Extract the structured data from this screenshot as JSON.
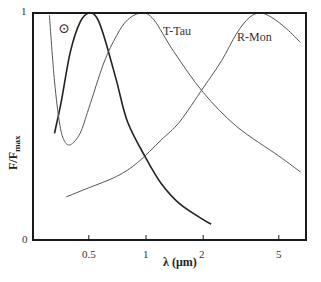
{
  "chart_data": {
    "type": "line",
    "title": "",
    "xlabel": "λ (μm)",
    "ylabel": "F/F_max",
    "ylabel_main": "F/F",
    "ylabel_sub": "max",
    "x_scale": "log",
    "xlim": [
      0.3,
      7
    ],
    "ylim": [
      0,
      1
    ],
    "x_ticks": [
      0.5,
      1,
      2,
      5
    ],
    "x_tick_labels": [
      "0.5",
      "1",
      "2",
      "5"
    ],
    "y_ticks": [
      0,
      1
    ],
    "y_tick_labels": [
      "0",
      "1"
    ],
    "grid": false,
    "legend": "none",
    "annotations": [
      {
        "text": "⊙",
        "x": 0.4,
        "y": 0.9,
        "meaning": "Sun"
      },
      {
        "text": "T-Tau",
        "x": 1.2,
        "y": 0.93
      },
      {
        "text": "R-Mon",
        "x": 3.6,
        "y": 0.83
      }
    ],
    "series": [
      {
        "name": "Sun",
        "points": [
          [
            0.33,
            0.47
          ],
          [
            0.36,
            0.62
          ],
          [
            0.4,
            0.83
          ],
          [
            0.45,
            0.96
          ],
          [
            0.5,
            1.0
          ],
          [
            0.55,
            0.98
          ],
          [
            0.6,
            0.9
          ],
          [
            0.7,
            0.7
          ],
          [
            0.8,
            0.52
          ],
          [
            1.0,
            0.36
          ],
          [
            1.2,
            0.25
          ],
          [
            1.5,
            0.16
          ],
          [
            2.0,
            0.09
          ],
          [
            2.2,
            0.07
          ]
        ]
      },
      {
        "name": "T-Tau",
        "points": [
          [
            0.31,
            0.99
          ],
          [
            0.33,
            0.7
          ],
          [
            0.35,
            0.52
          ],
          [
            0.37,
            0.44
          ],
          [
            0.4,
            0.42
          ],
          [
            0.45,
            0.47
          ],
          [
            0.5,
            0.58
          ],
          [
            0.6,
            0.78
          ],
          [
            0.7,
            0.9
          ],
          [
            0.8,
            0.97
          ],
          [
            0.95,
            1.0
          ],
          [
            1.1,
            0.97
          ],
          [
            1.4,
            0.83
          ],
          [
            2.0,
            0.65
          ],
          [
            3.0,
            0.5
          ],
          [
            5.0,
            0.37
          ],
          [
            6.5,
            0.3
          ]
        ]
      },
      {
        "name": "R-Mon",
        "points": [
          [
            0.38,
            0.19
          ],
          [
            0.5,
            0.23
          ],
          [
            0.7,
            0.28
          ],
          [
            0.9,
            0.34
          ],
          [
            1.2,
            0.44
          ],
          [
            1.5,
            0.52
          ],
          [
            2.0,
            0.67
          ],
          [
            2.5,
            0.79
          ],
          [
            3.0,
            0.91
          ],
          [
            3.5,
            0.98
          ],
          [
            4.0,
            1.0
          ],
          [
            4.6,
            0.98
          ],
          [
            5.5,
            0.93
          ],
          [
            6.5,
            0.87
          ]
        ]
      }
    ]
  },
  "plot": {
    "x_tick_labels": [
      "0.5",
      "1",
      "2",
      "5"
    ],
    "y_tick_labels": {
      "top": "1",
      "bottom": "0"
    },
    "xlabel": "λ (μm)",
    "ylabel_main": "F/F",
    "ylabel_sub": "max",
    "sun_symbol": "⊙",
    "label_ttau": "T-Tau",
    "label_rmon": "R-Mon"
  },
  "colors": {
    "frame": "#1a1a1a",
    "sun_curve": "#222222",
    "other_curves": "#555555",
    "text": "#333333"
  }
}
